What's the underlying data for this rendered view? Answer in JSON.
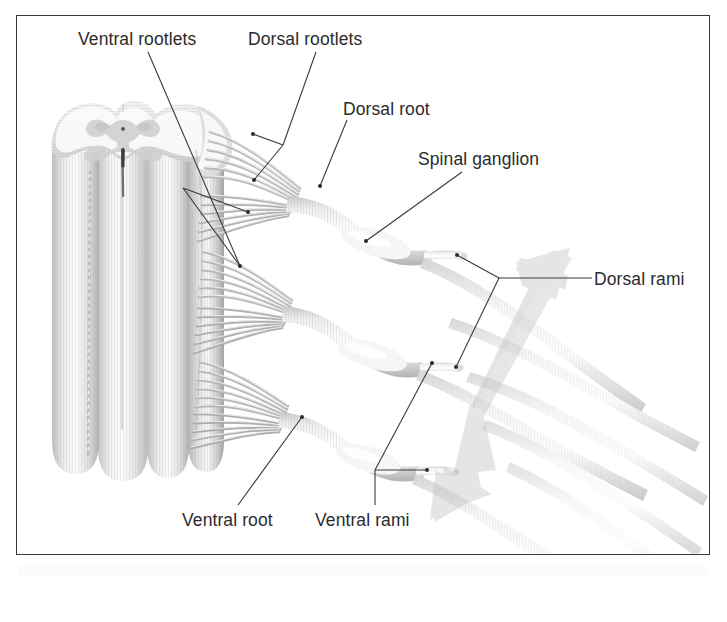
{
  "figure": {
    "domain": "anatomical-illustration",
    "background_color": "#ffffff",
    "frame_color": "#3a3a3c",
    "label_color": "#2b2b2d",
    "structure_fill_light": "#fdfdfd",
    "structure_fill_mid": "#d8d8d8",
    "structure_fill_dark": "#a8a8a8",
    "arrow_color": "#c9c9c9"
  },
  "labels": {
    "ventral_rootlets": "Ventral rootlets",
    "dorsal_rootlets": "Dorsal rootlets",
    "dorsal_root": "Dorsal root",
    "spinal_ganglion": "Spinal ganglion",
    "dorsal_rami": "Dorsal rami",
    "ventral_root": "Ventral root",
    "ventral_rami": "Ventral rami"
  },
  "anatomy": {
    "spinal_cord": {
      "name": "spinal cord",
      "cross_section": "butterfly-shaped gray matter with central canal and anterior median fissure",
      "columns": 4,
      "vessel": "anterior spinal vessel shown as beaded dotted line"
    },
    "segments": [
      {
        "index": 1,
        "label": "upper nerve segment"
      },
      {
        "index": 2,
        "label": "middle nerve segment"
      },
      {
        "index": 3,
        "label": "lower nerve segment"
      }
    ],
    "rootlet_count_per_segment": 12,
    "arrow": {
      "name": "double-headed orientation arrow",
      "direction": "diagonal, upper-right to lower-left"
    }
  }
}
